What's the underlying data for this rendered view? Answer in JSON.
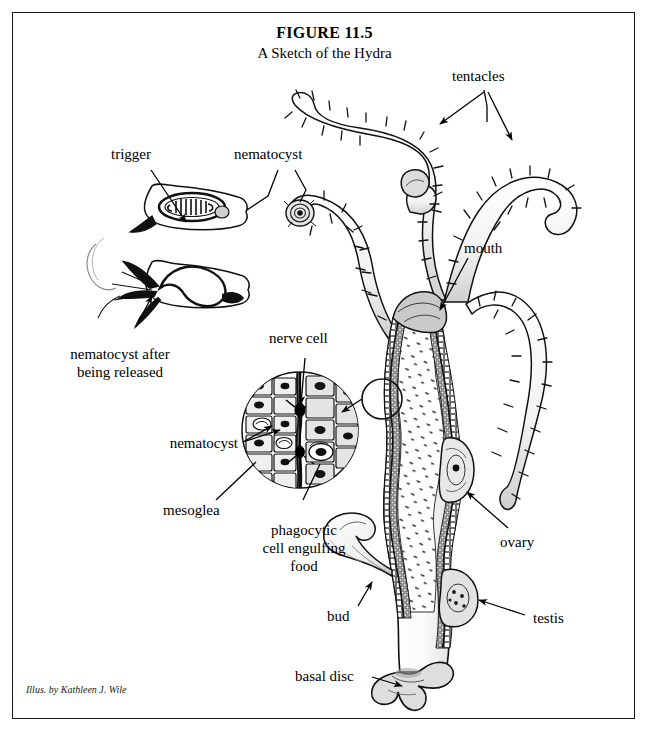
{
  "figure": {
    "title": "FIGURE 11.5",
    "subtitle": "A Sketch of the Hydra",
    "credit": "Illus. by Kathleen J. Wile"
  },
  "labels": {
    "trigger": "trigger",
    "nematocyst_top": "nematocyst",
    "nematocyst_released_line1": "nematocyst after",
    "nematocyst_released_line2": "being released",
    "nerve_cell": "nerve cell",
    "nematocyst_cell": "nematocyst",
    "mesoglea": "mesoglea",
    "phagocytic_line1": "phagocytic",
    "phagocytic_line2": "cell engulfing",
    "phagocytic_line3": "food",
    "tentacles": "tentacles",
    "mouth": "mouth",
    "ovary": "ovary",
    "testis": "testis",
    "bud": "bud",
    "basal_disc": "basal disc"
  },
  "colors": {
    "ink": "#000000",
    "border": "#1b1b1b",
    "background": "#ffffff",
    "shade_light": "#d8d8d8",
    "shade_mid": "#9a9a9a",
    "shade_dark": "#4a4a4a"
  }
}
